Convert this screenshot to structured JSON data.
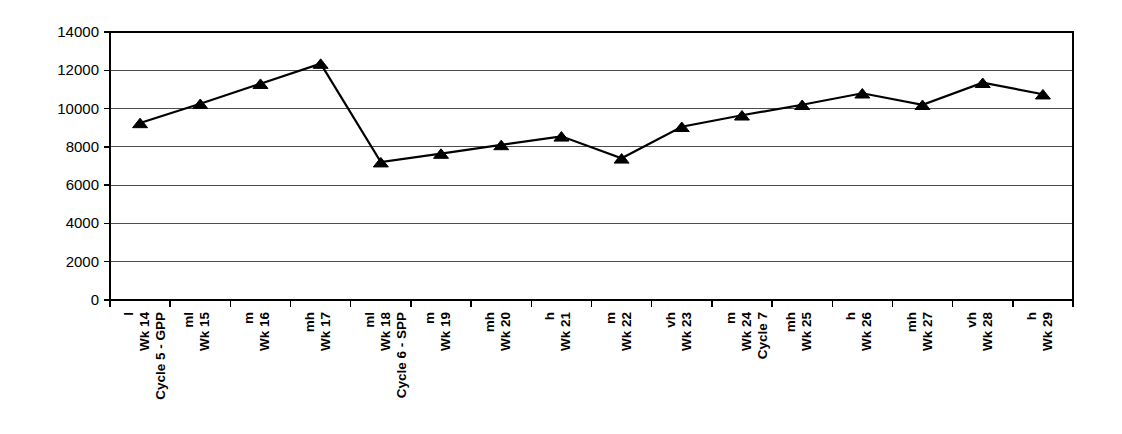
{
  "chart_data": {
    "type": "line",
    "title": "",
    "subtitle": "",
    "xlabel": "",
    "ylabel": "",
    "ylim": [
      0,
      14000
    ],
    "ytick_values": [
      0,
      2000,
      4000,
      6000,
      8000,
      10000,
      12000,
      14000
    ],
    "ytick_labels": [
      "0",
      "2000",
      "4000",
      "6000",
      "8000",
      "10000",
      "12000",
      "14000"
    ],
    "grid": true,
    "legend": "none",
    "marker": "triangle",
    "line_color": "#000000",
    "grid_color": "#4d4d4d",
    "axis_color": "#000000",
    "categories": [
      "l Wk 14 Cycle 5 - GPP",
      "ml Wk 15",
      "m Wk 16",
      "mh Wk 17",
      "ml Wk 18 Cycle 6 - SPP",
      "m Wk 19",
      "mh Wk 20",
      "h Wk 21",
      "m Wk 22",
      "vh Wk 23",
      "m Wk 24 Cycle 7",
      "mh Wk 25",
      "h Wk 26",
      "mh Wk 27",
      "vh Wk 28",
      "h Wk 29"
    ],
    "xtick_labels": [
      {
        "line1": "l",
        "line2": "Wk 14",
        "line3": "Cycle 5 - GPP",
        "bold": true
      },
      {
        "line1": "ml",
        "line2": "Wk 15",
        "line3": "",
        "bold": true
      },
      {
        "line1": "m",
        "line2": "Wk 16",
        "line3": "",
        "bold": true
      },
      {
        "line1": "mh",
        "line2": "Wk 17",
        "line3": "",
        "bold": true
      },
      {
        "line1": "ml",
        "line2": "Wk 18",
        "line3": "Cycle 6 - SPP",
        "bold": true
      },
      {
        "line1": "m",
        "line2": "Wk 19",
        "line3": "",
        "bold": true
      },
      {
        "line1": "mh",
        "line2": "Wk 20",
        "line3": "",
        "bold": true
      },
      {
        "line1": "h",
        "line2": "Wk 21",
        "line3": "",
        "bold": true
      },
      {
        "line1": "m",
        "line2": "Wk 22",
        "line3": "",
        "bold": true
      },
      {
        "line1": "vh",
        "line2": "Wk 23",
        "line3": "",
        "bold": true
      },
      {
        "line1": "m",
        "line2": "Wk 24",
        "line3": "Cycle 7",
        "bold": true
      },
      {
        "line1": "mh",
        "line2": "Wk 25",
        "line3": "",
        "bold": true
      },
      {
        "line1": "h",
        "line2": "Wk 26",
        "line3": "",
        "bold": true
      },
      {
        "line1": "mh",
        "line2": "Wk 27",
        "line3": "",
        "bold": true
      },
      {
        "line1": "vh",
        "line2": "Wk 28",
        "line3": "",
        "bold": true
      },
      {
        "line1": "h",
        "line2": "Wk 29",
        "line3": "",
        "bold": true
      }
    ],
    "values": [
      9250,
      10250,
      11300,
      12350,
      7200,
      7650,
      8100,
      8550,
      7400,
      9050,
      9650,
      10200,
      10800,
      10200,
      11350,
      10750
    ]
  }
}
